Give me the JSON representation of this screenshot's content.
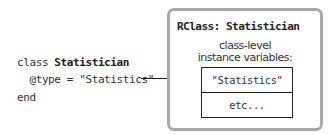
{
  "code": {
    "line1_keyword": "class ",
    "line1_name": "Statistician",
    "line2": "  @type = \"Statistics\"",
    "line3": "end"
  },
  "rclass_box": {
    "title": "RClass: Statistician",
    "subtitle_line1": "class-level",
    "subtitle_line2": "instance variables:",
    "cells": [
      "\"Statistics\"",
      "etc..."
    ]
  },
  "colors": {
    "outer_border": "#a8a8a8",
    "line": "#222222"
  }
}
